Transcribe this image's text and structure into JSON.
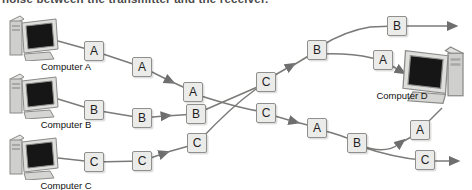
{
  "caption_fragment": "noise between the transmitter and the receiver.",
  "colors": {
    "line": "#757573",
    "box_fill": "#ebebe9",
    "box_border": "#8f8f8d",
    "icon_body": "#d9d9d7",
    "screen": "#161616",
    "text": "#1f1f1f"
  },
  "computers": [
    {
      "id": "computer-a",
      "label": "Computer A"
    },
    {
      "id": "computer-b",
      "label": "Computer B"
    },
    {
      "id": "computer-c",
      "label": "Computer C"
    },
    {
      "id": "computer-d",
      "label": "Computer D"
    }
  ],
  "packets": [
    {
      "label": "A",
      "x": 94,
      "y": 51
    },
    {
      "label": "A",
      "x": 142,
      "y": 67
    },
    {
      "label": "A",
      "x": 193,
      "y": 92
    },
    {
      "label": "B",
      "x": 94,
      "y": 110
    },
    {
      "label": "B",
      "x": 142,
      "y": 118
    },
    {
      "label": "B",
      "x": 196,
      "y": 114
    },
    {
      "label": "C",
      "x": 94,
      "y": 162
    },
    {
      "label": "C",
      "x": 142,
      "y": 161
    },
    {
      "label": "C",
      "x": 197,
      "y": 143
    },
    {
      "label": "C",
      "x": 266,
      "y": 82
    },
    {
      "label": "C",
      "x": 266,
      "y": 113
    },
    {
      "label": "B",
      "x": 317,
      "y": 50
    },
    {
      "label": "A",
      "x": 317,
      "y": 128
    },
    {
      "label": "B",
      "x": 397,
      "y": 26
    },
    {
      "label": "A",
      "x": 383,
      "y": 60
    },
    {
      "label": "B",
      "x": 357,
      "y": 143
    },
    {
      "label": "A",
      "x": 420,
      "y": 130
    },
    {
      "label": "C",
      "x": 425,
      "y": 160
    }
  ],
  "diagram": {
    "type": "packet-switched-network",
    "senders": [
      "Computer A",
      "Computer B",
      "Computer C"
    ],
    "receiver": "Computer D"
  }
}
